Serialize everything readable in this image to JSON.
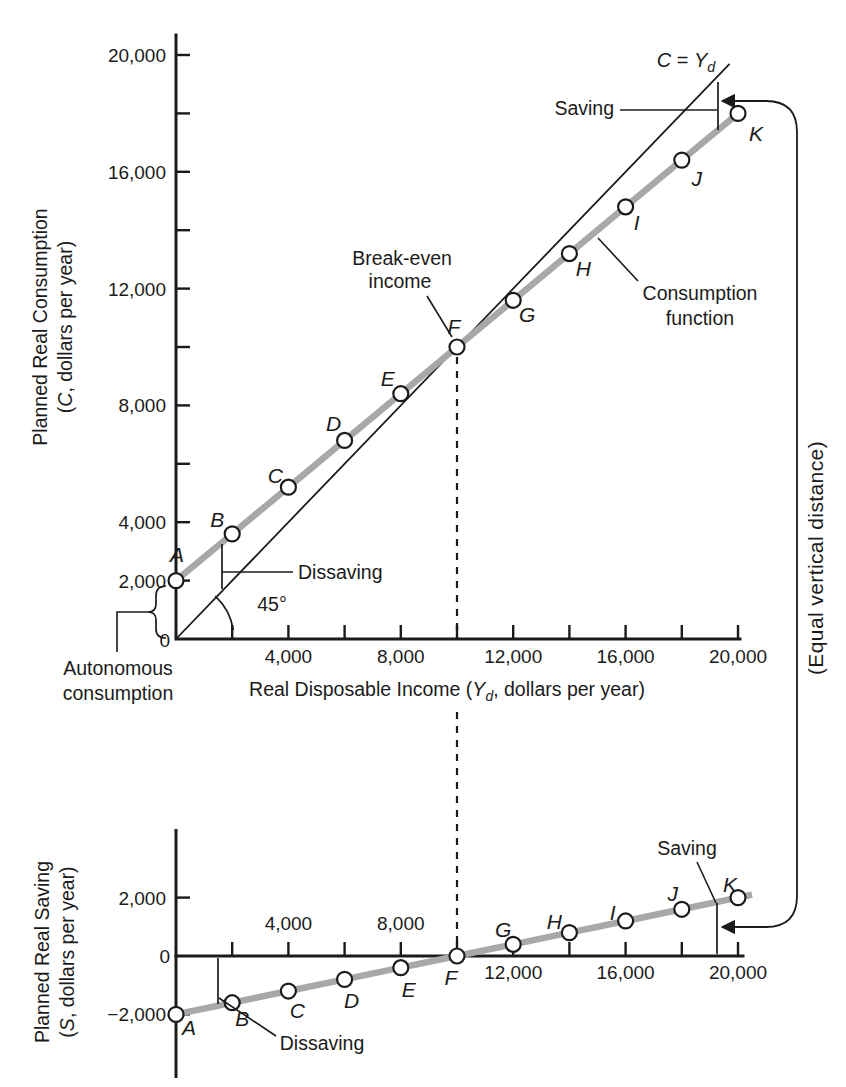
{
  "colors": {
    "ink": "#1b1b1b",
    "line_gray": "#a8a8a8",
    "point_fill": "#ffffff",
    "background": "#ffffff"
  },
  "top_chart": {
    "y_axis_title_lines": [
      [
        {
          "t": "Planned Real Consumption"
        }
      ],
      [
        {
          "t": "("
        },
        {
          "t": "C",
          "i": true
        },
        {
          "t": ", dollars per year)"
        }
      ]
    ],
    "x_axis_title": [
      {
        "t": "Real Disposable Income ("
      },
      {
        "t": "Y",
        "i": true
      },
      {
        "t": "d",
        "i": true,
        "sub": true
      },
      {
        "t": ", dollars per year)"
      }
    ],
    "origin_label": "0",
    "y_ticks": [
      {
        "v": 2000,
        "label": "2,000"
      },
      {
        "v": 4000,
        "label": "4,000"
      },
      {
        "v": 6000
      },
      {
        "v": 8000,
        "label": "8,000"
      },
      {
        "v": 10000
      },
      {
        "v": 12000,
        "label": "12,000"
      },
      {
        "v": 14000
      },
      {
        "v": 16000,
        "label": "16,000"
      },
      {
        "v": 18000
      },
      {
        "v": 20000,
        "label": "20,000"
      }
    ],
    "x_ticks": [
      {
        "v": 2000
      },
      {
        "v": 4000,
        "label": "4,000"
      },
      {
        "v": 6000
      },
      {
        "v": 8000,
        "label": "8,000"
      },
      {
        "v": 10000
      },
      {
        "v": 12000,
        "label": "12,000"
      },
      {
        "v": 14000
      },
      {
        "v": 16000,
        "label": "16,000"
      },
      {
        "v": 18000
      },
      {
        "v": 20000,
        "label": "20,000"
      }
    ],
    "annotations": {
      "identity_line_label": [
        {
          "t": "C",
          "i": true
        },
        {
          "t": " = "
        },
        {
          "t": "Y",
          "i": true
        },
        {
          "t": "d",
          "i": true,
          "sub": true
        }
      ],
      "saving": "Saving",
      "dissaving": "Dissaving",
      "angle": "45°",
      "break_even": [
        "Break-even",
        "income"
      ],
      "consumption_function": [
        "Consumption",
        "function"
      ],
      "autonomous": [
        "Autonomous",
        "consumption"
      ]
    }
  },
  "bottom_chart": {
    "y_axis_title_lines": [
      [
        {
          "t": "Planned Real Saving"
        }
      ],
      [
        {
          "t": "("
        },
        {
          "t": "S",
          "i": true
        },
        {
          "t": ", dollars per year)"
        }
      ]
    ],
    "origin_label": "0",
    "y_ticks": [
      {
        "v": 2000,
        "label": "2,000"
      },
      {
        "v": -2000,
        "label": "−2,000"
      }
    ],
    "x_ticks_labeled_above": [
      {
        "v": 2000
      },
      {
        "v": 4000,
        "label": "4,000"
      },
      {
        "v": 6000
      },
      {
        "v": 8000,
        "label": "8,000"
      }
    ],
    "x_ticks_labeled_below": [
      {
        "v": 10000
      },
      {
        "v": 12000,
        "label": "12,000"
      },
      {
        "v": 14000
      },
      {
        "v": 16000,
        "label": "16,000"
      },
      {
        "v": 18000
      },
      {
        "v": 20000,
        "label": "20,000"
      }
    ],
    "annotations": {
      "saving": "Saving",
      "dissaving": "Dissaving"
    }
  },
  "connector_label": "(Equal vertical distance)",
  "chart_data": [
    {
      "type": "line",
      "name": "planned-consumption",
      "title": "",
      "xlabel": "Real Disposable Income (Yd, dollars per year)",
      "ylabel": "Planned Real Consumption (C, dollars per year)",
      "xlim": [
        0,
        20000
      ],
      "ylim": [
        0,
        21000
      ],
      "x": [
        0,
        2000,
        4000,
        6000,
        8000,
        10000,
        12000,
        14000,
        16000,
        18000,
        20000
      ],
      "point_labels": [
        "A",
        "B",
        "C",
        "D",
        "E",
        "F",
        "G",
        "H",
        "I",
        "J",
        "K"
      ],
      "series": [
        {
          "name": "Consumption function",
          "values": [
            2000,
            3600,
            5200,
            6800,
            8400,
            10000,
            11600,
            13200,
            14800,
            16400,
            18000
          ]
        },
        {
          "name": "C = Yd (45-degree line)",
          "values": [
            0,
            2000,
            4000,
            6000,
            8000,
            10000,
            12000,
            14000,
            16000,
            18000,
            20000
          ]
        }
      ],
      "break_even_income": 10000,
      "autonomous_consumption": 2000,
      "grid": false,
      "legend": "none"
    },
    {
      "type": "line",
      "name": "planned-saving",
      "title": "",
      "xlabel": "Real Disposable Income (Yd, dollars per year)",
      "ylabel": "Planned Real Saving (S, dollars per year)",
      "xlim": [
        0,
        20000
      ],
      "ylim": [
        -3200,
        3600
      ],
      "x": [
        0,
        2000,
        4000,
        6000,
        8000,
        10000,
        12000,
        14000,
        16000,
        18000,
        20000
      ],
      "point_labels": [
        "A",
        "B",
        "C",
        "D",
        "E",
        "F",
        "G",
        "H",
        "I",
        "J",
        "K"
      ],
      "series": [
        {
          "name": "Saving function",
          "values": [
            -2000,
            -1600,
            -1200,
            -800,
            -400,
            0,
            400,
            800,
            1200,
            1600,
            2000
          ]
        }
      ],
      "break_even_income": 10000,
      "grid": false,
      "legend": "none"
    }
  ]
}
